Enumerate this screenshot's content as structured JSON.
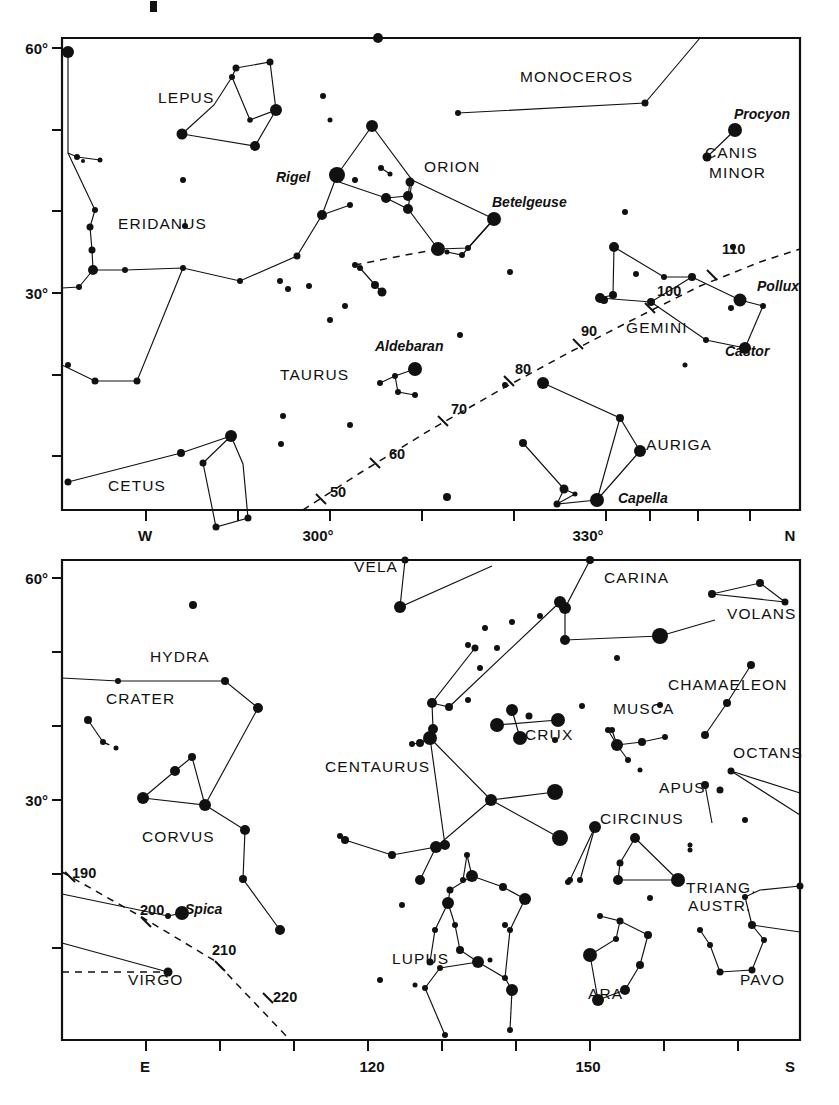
{
  "page": {
    "background": "#ffffff",
    "ink": "#111111"
  },
  "chart_data": [
    {
      "id": "upper-panel",
      "type": "scatter",
      "title": "",
      "xlabel": "",
      "ylabel": "",
      "xlim": [
        285,
        360
      ],
      "ylim": [
        0,
        67
      ],
      "grid": false,
      "legend": null,
      "x_ticks": [
        {
          "value": 285,
          "label": ""
        },
        {
          "value": 290,
          "label": "W"
        },
        {
          "value": 295,
          "label": ""
        },
        {
          "value": 300,
          "label": "300°"
        },
        {
          "value": 310,
          "label": ""
        },
        {
          "value": 320,
          "label": ""
        },
        {
          "value": 330,
          "label": "330°"
        },
        {
          "value": 340,
          "label": ""
        },
        {
          "value": 350,
          "label": ""
        },
        {
          "value": 360,
          "label": "N"
        }
      ],
      "y_ticks": [
        {
          "value": 60,
          "label": "60°"
        },
        {
          "value": 50,
          "label": ""
        },
        {
          "value": 40,
          "label": ""
        },
        {
          "value": 30,
          "label": "30°"
        },
        {
          "value": 20,
          "label": ""
        },
        {
          "value": 10,
          "label": ""
        }
      ],
      "ecliptic_labels": [
        "50",
        "60",
        "70",
        "80",
        "90",
        "100",
        "110"
      ],
      "constellations": [
        "LEPUS",
        "MONOCEROS",
        "CANIS MINOR",
        "ORION",
        "ERIDANUS",
        "TAURUS",
        "GEMINI",
        "AURIGA",
        "CETUS"
      ],
      "named_stars": [
        "Procyon",
        "Rigel",
        "Betelgeuse",
        "Pollux",
        "Castor",
        "Aldebaran",
        "Capella"
      ]
    },
    {
      "id": "lower-panel",
      "type": "scatter",
      "title": "",
      "xlabel": "",
      "ylabel": "",
      "xlim": [
        95,
        180
      ],
      "ylim": [
        0,
        67
      ],
      "grid": false,
      "legend": null,
      "x_ticks": [
        {
          "value": 95,
          "label": ""
        },
        {
          "value": 100,
          "label": "E"
        },
        {
          "value": 105,
          "label": ""
        },
        {
          "value": 110,
          "label": ""
        },
        {
          "value": 120,
          "label": "120"
        },
        {
          "value": 130,
          "label": ""
        },
        {
          "value": 140,
          "label": ""
        },
        {
          "value": 150,
          "label": "150"
        },
        {
          "value": 160,
          "label": ""
        },
        {
          "value": 170,
          "label": ""
        },
        {
          "value": 180,
          "label": "S"
        }
      ],
      "y_ticks": [
        {
          "value": 60,
          "label": "60°"
        },
        {
          "value": 50,
          "label": ""
        },
        {
          "value": 40,
          "label": ""
        },
        {
          "value": 30,
          "label": "30°"
        },
        {
          "value": 20,
          "label": ""
        },
        {
          "value": 10,
          "label": ""
        }
      ],
      "ecliptic_labels": [
        "190",
        "200",
        "210",
        "220"
      ],
      "constellations": [
        "VELA",
        "CARINA",
        "VOLANS",
        "HYDRA",
        "CHAMAELEON",
        "CRATER",
        "MUSCA",
        "CRUX",
        "OCTANS",
        "CENTAURUS",
        "APUS",
        "CORVUS",
        "CIRCINUS",
        "TRIANG. AUSTR.",
        "LUPUS",
        "ARA",
        "PAVO",
        "VIRGO"
      ],
      "named_stars": [
        "Spica"
      ]
    }
  ],
  "upper": {
    "y_axis": {
      "labels": [
        {
          "text": "60°",
          "y": 48
        },
        {
          "text": "30°",
          "y": 293
        }
      ],
      "tick_y": [
        48,
        130,
        211,
        293,
        375,
        456
      ]
    },
    "x_axis": {
      "labels": [
        {
          "text": "W",
          "x": 145
        },
        {
          "text": "300°",
          "x": 318
        },
        {
          "text": "330°",
          "x": 588
        },
        {
          "text": "N",
          "x": 790
        }
      ],
      "tick_x": [
        146,
        238,
        330,
        422,
        514,
        606,
        650,
        698,
        750
      ]
    },
    "ecliptic_numbers": [
      {
        "text": "50",
        "x": 330,
        "y": 497
      },
      {
        "text": "60",
        "x": 389,
        "y": 459
      },
      {
        "text": "70",
        "x": 451,
        "y": 414
      },
      {
        "text": "80",
        "x": 515,
        "y": 374
      },
      {
        "text": "90",
        "x": 581,
        "y": 336
      },
      {
        "text": "100",
        "x": 657,
        "y": 296
      },
      {
        "text": "110",
        "x": 722,
        "y": 254
      }
    ],
    "constellation_labels": [
      {
        "text": "LEPUS",
        "x": 158,
        "y": 103
      },
      {
        "text": "MONOCEROS",
        "x": 520,
        "y": 82
      },
      {
        "text": "ORION",
        "x": 424,
        "y": 172
      },
      {
        "text": "CANIS",
        "x": 705,
        "y": 158
      },
      {
        "text": "MINOR",
        "x": 709,
        "y": 178
      },
      {
        "text": "ERIDANUS",
        "x": 118,
        "y": 229
      },
      {
        "text": "TAURUS",
        "x": 280,
        "y": 380
      },
      {
        "text": "GEMINI",
        "x": 626,
        "y": 333
      },
      {
        "text": "AURIGA",
        "x": 646,
        "y": 450
      },
      {
        "text": "CETUS",
        "x": 108,
        "y": 491
      }
    ],
    "star_labels": [
      {
        "text": "Procyon",
        "x": 734,
        "y": 119
      },
      {
        "text": "Rigel",
        "x": 276,
        "y": 182
      },
      {
        "text": "Betelgeuse",
        "x": 492,
        "y": 207
      },
      {
        "text": "Pollux",
        "x": 757,
        "y": 291
      },
      {
        "text": "Castor",
        "x": 725,
        "y": 356
      },
      {
        "text": "Aldebaran",
        "x": 375,
        "y": 351
      },
      {
        "text": "Capella",
        "x": 618,
        "y": 503
      }
    ]
  },
  "lower": {
    "y_axis": {
      "labels": [
        {
          "text": "60°",
          "y": 578
        },
        {
          "text": "30°",
          "y": 800
        }
      ],
      "tick_y": [
        578,
        652,
        726,
        800,
        874,
        948
      ]
    },
    "x_axis": {
      "labels": [
        {
          "text": "E",
          "x": 145
        },
        {
          "text": "120",
          "x": 372
        },
        {
          "text": "150",
          "x": 588
        },
        {
          "text": "S",
          "x": 790
        }
      ],
      "tick_x": [
        146,
        220,
        294,
        368,
        442,
        516,
        590,
        664,
        738
      ]
    },
    "ecliptic_numbers": [
      {
        "text": "190",
        "x": 72,
        "y": 878
      },
      {
        "text": "200",
        "x": 140,
        "y": 915
      },
      {
        "text": "210",
        "x": 212,
        "y": 955
      },
      {
        "text": "220",
        "x": 273,
        "y": 1002
      }
    ],
    "constellation_labels": [
      {
        "text": "VELA",
        "x": 354,
        "y": 572
      },
      {
        "text": "CARINA",
        "x": 604,
        "y": 583
      },
      {
        "text": "VOLANS",
        "x": 727,
        "y": 619
      },
      {
        "text": "HYDRA",
        "x": 150,
        "y": 662
      },
      {
        "text": "CHAMAELEON",
        "x": 668,
        "y": 690
      },
      {
        "text": "CRATER",
        "x": 106,
        "y": 704
      },
      {
        "text": "MUSCA",
        "x": 613,
        "y": 714
      },
      {
        "text": "CRUX",
        "x": 525,
        "y": 740
      },
      {
        "text": "OCTANS",
        "x": 733,
        "y": 758
      },
      {
        "text": "CENTAURUS",
        "x": 325,
        "y": 772
      },
      {
        "text": "APUS",
        "x": 659,
        "y": 793
      },
      {
        "text": "CORVUS",
        "x": 142,
        "y": 842
      },
      {
        "text": "CIRCINUS",
        "x": 600,
        "y": 824
      },
      {
        "text": "TRIANG.",
        "x": 686,
        "y": 893
      },
      {
        "text": "AUSTR.",
        "x": 688,
        "y": 911
      },
      {
        "text": "LUPUS",
        "x": 392,
        "y": 964
      },
      {
        "text": "ARA",
        "x": 588,
        "y": 999
      },
      {
        "text": "PAVO",
        "x": 740,
        "y": 985
      },
      {
        "text": "VIRGO",
        "x": 128,
        "y": 985
      }
    ],
    "star_labels": [
      {
        "text": "Spica",
        "x": 185,
        "y": 914
      }
    ]
  }
}
